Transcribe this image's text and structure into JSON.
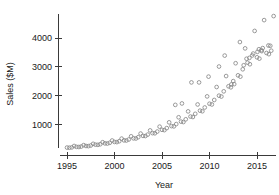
{
  "chart_data": {
    "type": "scatter",
    "title": "",
    "xlabel": "Year",
    "ylabel": "Sales ($M)",
    "xlim": [
      1994.6,
      2017.0
    ],
    "ylim": [
      0,
      4900
    ],
    "xticks": [
      1995,
      2000,
      2005,
      2010,
      2015
    ],
    "xtick_labels": [
      "1995",
      "2000",
      "2005",
      "2010",
      "2015"
    ],
    "yticks": [
      1000,
      2000,
      3000,
      4000
    ],
    "ytick_labels": [
      "1000",
      "2000",
      "3000",
      "4000"
    ],
    "grid": false,
    "legend": "none",
    "marker": "open-circle",
    "marker_color": "#888888",
    "points": [
      [
        1995.0,
        200
      ],
      [
        1995.25,
        195
      ],
      [
        1995.5,
        205
      ],
      [
        1995.75,
        255
      ],
      [
        1996.0,
        225
      ],
      [
        1996.25,
        220
      ],
      [
        1996.5,
        235
      ],
      [
        1996.75,
        285
      ],
      [
        1997.0,
        255
      ],
      [
        1997.25,
        250
      ],
      [
        1997.5,
        270
      ],
      [
        1997.75,
        330
      ],
      [
        1998.0,
        300
      ],
      [
        1998.25,
        295
      ],
      [
        1998.5,
        315
      ],
      [
        1998.75,
        385
      ],
      [
        1999.0,
        345
      ],
      [
        1999.25,
        340
      ],
      [
        1999.5,
        365
      ],
      [
        1999.75,
        445
      ],
      [
        2000.0,
        395
      ],
      [
        2000.25,
        390
      ],
      [
        2000.5,
        420
      ],
      [
        2000.75,
        510
      ],
      [
        2001.0,
        450
      ],
      [
        2001.25,
        445
      ],
      [
        2001.5,
        480
      ],
      [
        2001.75,
        590
      ],
      [
        2002.0,
        520
      ],
      [
        2002.25,
        515
      ],
      [
        2002.5,
        560
      ],
      [
        2002.75,
        685
      ],
      [
        2003.0,
        605
      ],
      [
        2003.25,
        600
      ],
      [
        2003.5,
        650
      ],
      [
        2003.75,
        795
      ],
      [
        2004.0,
        700
      ],
      [
        2004.25,
        695
      ],
      [
        2004.5,
        755
      ],
      [
        2004.75,
        925
      ],
      [
        2005.0,
        815
      ],
      [
        2005.25,
        805
      ],
      [
        2005.5,
        875
      ],
      [
        2005.75,
        1075
      ],
      [
        2006.0,
        945
      ],
      [
        2006.25,
        935
      ],
      [
        2006.5,
        1015
      ],
      [
        2006.75,
        1250
      ],
      [
        2007.0,
        1100
      ],
      [
        2007.25,
        1085
      ],
      [
        2007.5,
        1180
      ],
      [
        2007.75,
        1455
      ],
      [
        2008.0,
        1275
      ],
      [
        2008.25,
        1260
      ],
      [
        2008.5,
        1370
      ],
      [
        2008.75,
        1695
      ],
      [
        2009.0,
        1480
      ],
      [
        2009.25,
        1460
      ],
      [
        2009.5,
        1590
      ],
      [
        2009.75,
        1975
      ],
      [
        2010.0,
        1720
      ],
      [
        2010.25,
        1695
      ],
      [
        2010.5,
        1850
      ],
      [
        2010.75,
        2300
      ],
      [
        2011.0,
        2000
      ],
      [
        2011.25,
        1970
      ],
      [
        2011.5,
        2150
      ],
      [
        2011.75,
        2680
      ],
      [
        2012.0,
        2325
      ],
      [
        2012.25,
        2290
      ],
      [
        2012.5,
        2505
      ],
      [
        2012.75,
        3125
      ],
      [
        2013.0,
        2705
      ],
      [
        2013.25,
        2660
      ],
      [
        2013.5,
        2915
      ],
      [
        2013.75,
        3640
      ],
      [
        2014.0,
        3145
      ],
      [
        2014.25,
        3090
      ],
      [
        2014.5,
        3395
      ],
      [
        2014.75,
        4245
      ],
      [
        2015.0,
        3330
      ],
      [
        2015.25,
        3285
      ],
      [
        2015.5,
        3545
      ],
      [
        2015.75,
        4620
      ],
      [
        2016.0,
        3480
      ],
      [
        2016.25,
        3440
      ],
      [
        2016.5,
        3560
      ],
      [
        2016.75,
        4760
      ],
      [
        2006.4,
        1680
      ],
      [
        2007.1,
        1730
      ],
      [
        2008.1,
        2460
      ],
      [
        2008.9,
        2460
      ],
      [
        2009.9,
        2660
      ],
      [
        2011.0,
        3010
      ],
      [
        2011.6,
        3390
      ],
      [
        2013.2,
        3860
      ],
      [
        2015.2,
        3610
      ],
      [
        2015.6,
        3650
      ],
      [
        2016.2,
        3740
      ],
      [
        2016.4,
        3730
      ],
      [
        2012.3,
        2390
      ],
      [
        2012.6,
        2400
      ],
      [
        2013.6,
        3055
      ],
      [
        2013.9,
        3280
      ],
      [
        2014.2,
        3310
      ],
      [
        2014.6,
        3460
      ],
      [
        2015.05,
        3520
      ],
      [
        2015.45,
        3580
      ]
    ]
  }
}
